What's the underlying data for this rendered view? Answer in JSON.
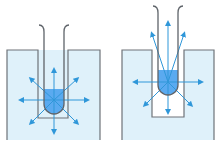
{
  "figure": {
    "width": 224,
    "height": 149,
    "colors": {
      "background": "#ffffff",
      "medium_fill": "#dff1fa",
      "well_fill": "#ffffff",
      "outline": "#6e7379",
      "tube_outline": "#5f646a",
      "liquid": "#5aaaf0",
      "liquid_stroke": "#3f6fa8",
      "arrow": "#2f97d9"
    },
    "panels": [
      {
        "id": "left",
        "label": "Tube in narrow well surrounded by medium",
        "container": {
          "x": 7,
          "y": 50,
          "w": 93,
          "h": 90
        },
        "well": {
          "x": 38,
          "y": 50,
          "w": 30,
          "h": 68,
          "filled": true
        },
        "tube": {
          "x": 44,
          "top": 25,
          "w": 20,
          "liquid_top": 89,
          "bottom": 114
        },
        "center": {
          "cx": 54,
          "cy": 100
        },
        "arrows": [
          {
            "dx": 0,
            "dy": -30
          },
          {
            "dx": 0,
            "dy": 32
          },
          {
            "dx": -33,
            "dy": 0
          },
          {
            "dx": 33,
            "dy": 0
          },
          {
            "dx": -23,
            "dy": -21
          },
          {
            "dx": 23,
            "dy": -21
          },
          {
            "dx": -23,
            "dy": 23
          },
          {
            "dx": 23,
            "dy": 23
          }
        ]
      },
      {
        "id": "right",
        "label": "Tube raised in well with open space below",
        "container": {
          "x": 122,
          "y": 50,
          "w": 92,
          "h": 90
        },
        "well": {
          "x": 152,
          "y": 50,
          "w": 32,
          "h": 67,
          "filled": false
        },
        "tube": {
          "x": 158,
          "top": 6,
          "w": 20,
          "liquid_top": 70,
          "bottom": 95
        },
        "center": {
          "cx": 168,
          "cy": 82
        },
        "arrows": [
          {
            "dx": 0,
            "dy": -59
          },
          {
            "dx": 0,
            "dy": 30
          },
          {
            "dx": -33,
            "dy": 0
          },
          {
            "dx": 33,
            "dy": 0
          },
          {
            "dx": -16,
            "dy": -48
          },
          {
            "dx": 16,
            "dy": -48
          },
          {
            "dx": -23,
            "dy": 23
          },
          {
            "dx": 23,
            "dy": 23
          }
        ]
      }
    ]
  }
}
